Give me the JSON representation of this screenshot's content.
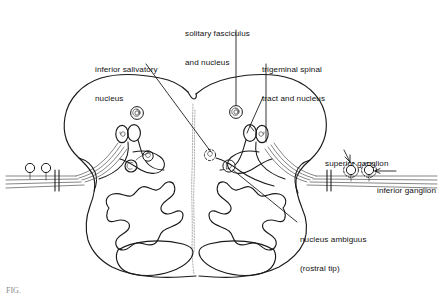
{
  "figure": {
    "domain": "diagram",
    "background_color": "#ffffff",
    "ink_color": "#1a1a1a",
    "midline_color": "#b4b4b4",
    "caption": "FIG.  "
  },
  "labels": {
    "solitary": {
      "id": "solitary-fasciculus-and-nucleus",
      "line1": "solitary fasciculus",
      "line2": "and nucleus"
    },
    "inferior_salivatory": {
      "id": "inferior-salivatory-nucleus",
      "line1": "inferior salivatory",
      "line2": "nucleus"
    },
    "trigeminal": {
      "id": "trigeminal-spinal-tract-and-nucleus",
      "line1": "trigeminal spinal",
      "line2": "tract and nucleus"
    },
    "superior_ganglion": {
      "id": "superior-ganglion",
      "line1": "superior ganglion"
    },
    "inferior_ganglion": {
      "id": "inferior-ganglion",
      "line1": "inferior ganglion"
    },
    "nucleus_ambiguus": {
      "id": "nucleus-ambiguus-rostral-tip",
      "line1": "nucleus ambiguus",
      "line2": "(rostral tip)"
    }
  },
  "structures": [
    {
      "name": "medulla-outline",
      "side": "both",
      "style": "solid"
    },
    {
      "name": "midline-raphe",
      "side": "both",
      "style": "dotted-gray"
    },
    {
      "name": "inferior-olivary-nucleus-left",
      "side": "left",
      "style": "convoluted-band"
    },
    {
      "name": "inferior-olivary-nucleus-right",
      "side": "right",
      "style": "convoluted-band"
    },
    {
      "name": "pyramid-left",
      "side": "left",
      "style": "lens"
    },
    {
      "name": "pyramid-right",
      "side": "right",
      "style": "lens"
    },
    {
      "name": "solitary-nucleus-left",
      "side": "left",
      "style": "spiral-circle"
    },
    {
      "name": "solitary-nucleus-right",
      "side": "right",
      "style": "spiral-circle"
    },
    {
      "name": "trigeminal-nucleus-left",
      "side": "left",
      "style": "paired-ovals"
    },
    {
      "name": "trigeminal-nucleus-right",
      "side": "right",
      "style": "paired-ovals"
    },
    {
      "name": "inferior-salivatory-nucleus-left",
      "side": "left",
      "style": "small-circle"
    },
    {
      "name": "nucleus-ambiguus-left",
      "side": "left",
      "style": "small-circle"
    },
    {
      "name": "nucleus-ambiguus-right",
      "side": "right",
      "style": "small-circle"
    },
    {
      "name": "dorsal-vagal-nucleus-right",
      "side": "right",
      "style": "dashed-small-circle"
    },
    {
      "name": "nerve-rootlets-left",
      "side": "left",
      "style": "fiber-bundle"
    },
    {
      "name": "nerve-rootlets-right",
      "side": "right",
      "style": "fiber-bundle"
    },
    {
      "name": "superior-ganglion-marker",
      "side": "right",
      "style": "dashed-circle"
    },
    {
      "name": "inferior-ganglion-marker",
      "side": "right",
      "style": "solid-circle"
    },
    {
      "name": "ganglion-marker-left-a",
      "side": "left",
      "style": "solid-circle"
    },
    {
      "name": "ganglion-marker-left-b",
      "side": "left",
      "style": "solid-circle"
    }
  ]
}
